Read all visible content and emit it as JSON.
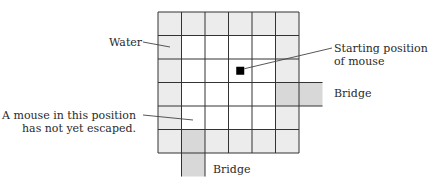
{
  "diagram": {
    "grid": {
      "rows": 6,
      "cols": 6,
      "origin_x": 158,
      "origin_y": 12,
      "cell": 23.5,
      "water_color": "#ececec",
      "land_color": "#ffffff",
      "bridge_color": "#d8d8d8",
      "line_color": "#333333"
    },
    "mouse": {
      "row": 2,
      "col": 3,
      "color": "#000000"
    },
    "bridges": [
      {
        "id": "right",
        "row": 3,
        "col": 5,
        "direction": "right"
      },
      {
        "id": "bottom",
        "row": 5,
        "col": 1,
        "direction": "down"
      }
    ],
    "labels": {
      "water": "Water",
      "start_line1": "Starting position",
      "start_line2": "of mouse",
      "bridge_right": "Bridge",
      "bridge_bottom": "Bridge",
      "escape_line1": "A mouse in this position",
      "escape_line2": "has not yet escaped."
    }
  }
}
